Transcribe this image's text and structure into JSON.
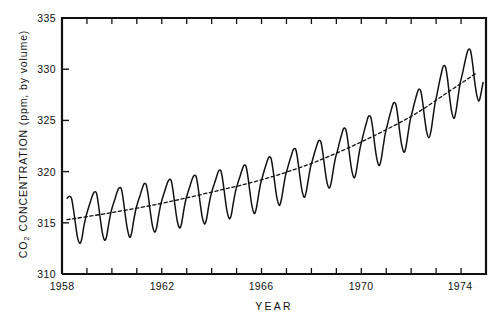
{
  "chart_data": {
    "type": "line",
    "title": "",
    "subtitle": "",
    "xlabel": "YEAR",
    "ylabel": "CO2 CONCENTRATION (ppm, by volume)",
    "ylabel_prefix": "CO",
    "ylabel_sub": "2",
    "ylabel_rest": " CONCENTRATION (ppm, by volume)",
    "xlim": [
      1958,
      1975
    ],
    "ylim": [
      310,
      335
    ],
    "grid": false,
    "legend": null,
    "legend_position": "none",
    "ytick_labels": [
      "310",
      "315",
      "320",
      "325",
      "330",
      "335"
    ],
    "ytick_values": [
      310,
      315,
      320,
      325,
      330,
      335
    ],
    "ytick_minor_step": 5,
    "xtick_labels": [
      "1958",
      "1962",
      "1966",
      "1970",
      "1974"
    ],
    "xtick_values": [
      1958,
      1962,
      1966,
      1970,
      1974
    ],
    "xtick_minor_values": [
      1958,
      1959,
      1960,
      1961,
      1962,
      1963,
      1964,
      1965,
      1966,
      1967,
      1968,
      1969,
      1970,
      1971,
      1972,
      1973,
      1974,
      1975
    ],
    "axis_color": "#111111",
    "series": [
      {
        "name": "Monthly mean CO2 concentration",
        "style": "solid",
        "color": "#111111",
        "x": [
          1958.21,
          1958.29,
          1958.38,
          1958.46,
          1958.54,
          1958.62,
          1958.71,
          1958.79,
          1958.88,
          1958.96,
          1959.04,
          1959.12,
          1959.21,
          1959.29,
          1959.38,
          1959.46,
          1959.54,
          1959.62,
          1959.71,
          1959.79,
          1959.88,
          1959.96,
          1960.04,
          1960.12,
          1960.21,
          1960.29,
          1960.38,
          1960.46,
          1960.54,
          1960.62,
          1960.71,
          1960.79,
          1960.88,
          1960.96,
          1961.04,
          1961.12,
          1961.21,
          1961.29,
          1961.38,
          1961.46,
          1961.54,
          1961.62,
          1961.71,
          1961.79,
          1961.88,
          1961.96,
          1962.04,
          1962.12,
          1962.21,
          1962.29,
          1962.38,
          1962.46,
          1962.54,
          1962.62,
          1962.71,
          1962.79,
          1962.88,
          1962.96,
          1963.04,
          1963.12,
          1963.21,
          1963.29,
          1963.38,
          1963.46,
          1963.54,
          1963.62,
          1963.71,
          1963.79,
          1963.88,
          1963.96,
          1964.04,
          1964.12,
          1964.21,
          1964.29,
          1964.38,
          1964.46,
          1964.54,
          1964.62,
          1964.71,
          1964.79,
          1964.88,
          1964.96,
          1965.04,
          1965.12,
          1965.21,
          1965.29,
          1965.38,
          1965.46,
          1965.54,
          1965.62,
          1965.71,
          1965.79,
          1965.88,
          1965.96,
          1966.04,
          1966.12,
          1966.21,
          1966.29,
          1966.38,
          1966.46,
          1966.54,
          1966.62,
          1966.71,
          1966.79,
          1966.88,
          1966.96,
          1967.04,
          1967.12,
          1967.21,
          1967.29,
          1967.38,
          1967.46,
          1967.54,
          1967.62,
          1967.71,
          1967.79,
          1967.88,
          1967.96,
          1968.04,
          1968.12,
          1968.21,
          1968.29,
          1968.38,
          1968.46,
          1968.54,
          1968.62,
          1968.71,
          1968.79,
          1968.88,
          1968.96,
          1969.04,
          1969.12,
          1969.21,
          1969.29,
          1969.38,
          1969.46,
          1969.54,
          1969.62,
          1969.71,
          1969.79,
          1969.88,
          1969.96,
          1970.04,
          1970.12,
          1970.21,
          1970.29,
          1970.38,
          1970.46,
          1970.54,
          1970.62,
          1970.71,
          1970.79,
          1970.88,
          1970.96,
          1971.04,
          1971.12,
          1971.21,
          1971.29,
          1971.38,
          1971.46,
          1971.54,
          1971.62,
          1971.71,
          1971.79,
          1971.88,
          1971.96,
          1972.04,
          1972.12,
          1972.21,
          1972.29,
          1972.38,
          1972.46,
          1972.54,
          1972.62,
          1972.71,
          1972.79,
          1972.88,
          1972.96,
          1973.04,
          1973.12,
          1973.21,
          1973.29,
          1973.38,
          1973.46,
          1973.54,
          1973.62,
          1973.71,
          1973.79,
          1973.88,
          1973.96,
          1974.04,
          1974.12,
          1974.21,
          1974.29,
          1974.38,
          1974.46,
          1974.54,
          1974.62,
          1974.71,
          1974.79,
          1974.88
        ],
        "y": [
          317.4,
          317.6,
          317.4,
          316.3,
          314.9,
          313.6,
          313.0,
          313.4,
          314.7,
          315.6,
          316.3,
          316.9,
          317.6,
          318.0,
          317.9,
          316.8,
          315.3,
          314.0,
          313.3,
          313.7,
          315.0,
          316.0,
          316.7,
          317.3,
          318.0,
          318.4,
          318.3,
          317.2,
          315.7,
          314.4,
          313.6,
          314.0,
          315.3,
          316.3,
          317.0,
          317.6,
          318.3,
          318.8,
          318.7,
          317.6,
          316.1,
          314.8,
          314.1,
          314.5,
          315.8,
          316.8,
          317.5,
          318.1,
          318.8,
          319.2,
          319.1,
          318.0,
          316.5,
          315.2,
          314.5,
          314.9,
          316.2,
          317.2,
          317.9,
          318.5,
          319.2,
          319.6,
          319.5,
          318.4,
          316.9,
          315.6,
          314.9,
          315.3,
          316.6,
          317.6,
          318.3,
          318.9,
          319.6,
          320.1,
          320.0,
          318.9,
          317.4,
          316.1,
          315.4,
          315.8,
          317.1,
          318.1,
          318.8,
          319.4,
          320.1,
          320.6,
          320.5,
          319.4,
          317.9,
          316.6,
          315.9,
          316.4,
          317.7,
          318.8,
          319.5,
          320.2,
          320.9,
          321.4,
          321.3,
          320.2,
          318.7,
          317.4,
          316.7,
          317.2,
          318.5,
          319.6,
          320.3,
          321.0,
          321.7,
          322.2,
          322.1,
          321.0,
          319.5,
          318.2,
          317.5,
          318.0,
          319.3,
          320.4,
          321.1,
          321.8,
          322.5,
          323.0,
          322.9,
          321.8,
          320.3,
          319.0,
          318.4,
          318.9,
          320.2,
          321.3,
          322.0,
          322.8,
          323.6,
          324.2,
          324.1,
          323.0,
          321.4,
          320.1,
          319.4,
          319.9,
          321.3,
          322.4,
          323.2,
          324.0,
          324.8,
          325.4,
          325.3,
          324.2,
          322.6,
          321.3,
          320.6,
          321.1,
          322.5,
          323.7,
          324.5,
          325.3,
          326.1,
          326.7,
          326.6,
          325.5,
          323.9,
          322.6,
          321.9,
          322.4,
          323.8,
          325.0,
          325.8,
          326.6,
          327.4,
          328.0,
          327.9,
          326.8,
          325.2,
          323.9,
          323.3,
          323.9,
          325.4,
          326.7,
          327.6,
          328.6,
          329.6,
          330.3,
          330.2,
          329.0,
          327.3,
          325.9,
          325.2,
          325.8,
          327.3,
          328.6,
          329.4,
          330.3,
          331.3,
          331.9,
          331.8,
          330.6,
          328.9,
          327.6,
          326.9,
          327.5,
          328.7
        ]
      },
      {
        "name": "Trend (annual mean)",
        "style": "dashed",
        "color": "#111111",
        "x": [
          1958.2,
          1960,
          1962,
          1964,
          1966,
          1968,
          1970,
          1972,
          1973.5,
          1974.6
        ],
        "y": [
          315.3,
          316.0,
          316.9,
          318.0,
          319.2,
          320.8,
          322.9,
          325.4,
          327.8,
          329.6
        ]
      }
    ]
  },
  "plot": {
    "left": 62,
    "top": 18,
    "right": 486,
    "bottom": 274
  }
}
